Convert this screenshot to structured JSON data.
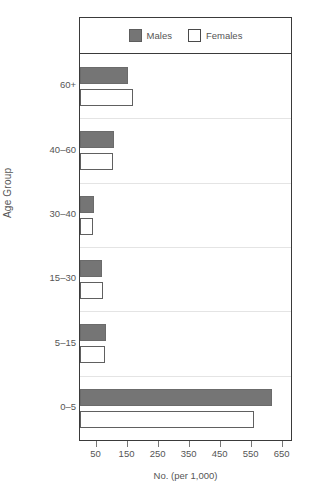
{
  "chart_data": {
    "type": "bar",
    "orientation": "horizontal",
    "title": "",
    "xlabel": "No. (per 1,000)",
    "ylabel": "Age Group",
    "categories": [
      "60+",
      "40–60",
      "30–40",
      "15–30",
      "5–15",
      "0–5"
    ],
    "series": [
      {
        "name": "Males",
        "color": "#757575",
        "values": [
          155,
          110,
          45,
          70,
          85,
          620
        ]
      },
      {
        "name": "Females",
        "color": "#ffffff",
        "values": [
          170,
          105,
          42,
          75,
          80,
          560
        ]
      }
    ],
    "xlim": [
      0,
      680
    ],
    "xticks": [
      50,
      150,
      250,
      350,
      450,
      550,
      650
    ],
    "xtick_labels": [
      "50",
      "150",
      "250",
      "350",
      "450",
      "550",
      "650"
    ],
    "grid": "horizontal-band-separators",
    "legend_position": "top-inside"
  },
  "legend": {
    "entries": [
      {
        "label": "Males",
        "swatch": "filled-gray-square"
      },
      {
        "label": "Females",
        "swatch": "open-white-square"
      }
    ]
  },
  "axes": {
    "y_title": "Age Group",
    "x_title": "No. (per 1,000)"
  },
  "colors": {
    "male_fill": "#757575",
    "female_fill": "#ffffff",
    "frame": "#3a3a3a",
    "gridline": "#e4e4e4",
    "text": "#555555"
  }
}
